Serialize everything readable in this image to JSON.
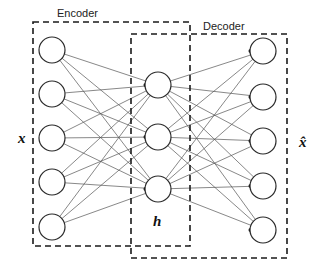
{
  "diagram": {
    "type": "autoencoder-network",
    "labels": {
      "encoder": "Encoder",
      "decoder": "Decoder",
      "input": "x",
      "hidden": "h",
      "output": "x̂"
    },
    "layers": [
      {
        "name": "input",
        "node_count": 5,
        "cx": 52,
        "ys": [
          50,
          94,
          138,
          182,
          227
        ]
      },
      {
        "name": "hidden",
        "node_count": 3,
        "cx": 158,
        "ys": [
          85,
          137,
          189
        ]
      },
      {
        "name": "output",
        "node_count": 5,
        "cx": 263,
        "ys": [
          51,
          97,
          141,
          186,
          230
        ]
      }
    ],
    "node_radius": 13,
    "boxes": {
      "encoder": {
        "x": 33,
        "y": 22,
        "w": 157,
        "h": 224
      },
      "decoder": {
        "x": 131,
        "y": 34,
        "w": 156,
        "h": 224
      }
    },
    "colors": {
      "stroke": "#2a2a2a",
      "edge": "#555555",
      "background": "#ffffff"
    }
  }
}
